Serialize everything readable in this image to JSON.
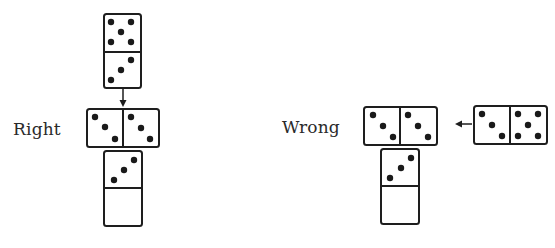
{
  "labels": {
    "right": "Right",
    "wrong": "Wrong"
  },
  "colors": {
    "stroke": "#1e1e1e",
    "pip": "#1a1a1a",
    "background": "#ffffff"
  },
  "right_example": {
    "label": "Right",
    "dominoes": [
      {
        "orientation": "vertical",
        "top": 5,
        "bottom": 3
      },
      {
        "orientation": "horizontal",
        "left": 3,
        "right": 3,
        "note": "double placed crosswise"
      },
      {
        "orientation": "vertical",
        "top": 3,
        "bottom": 0
      }
    ],
    "arrow": "down"
  },
  "wrong_example": {
    "label": "Wrong",
    "dominoes": [
      {
        "orientation": "horizontal",
        "left": 3,
        "right": 3
      },
      {
        "orientation": "vertical",
        "top": 3,
        "bottom": 0
      },
      {
        "orientation": "horizontal",
        "left": 3,
        "right": 5,
        "note": "incoming tile"
      }
    ],
    "arrow": "left"
  }
}
